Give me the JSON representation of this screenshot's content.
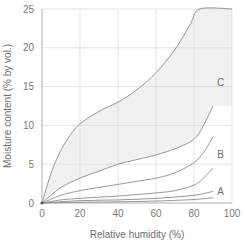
{
  "chart_data": {
    "type": "line",
    "title": "",
    "xlabel": "Relative humidity (%)",
    "ylabel": "Moisture content (% by vol.)",
    "xlim": [
      0,
      100
    ],
    "ylim": [
      0,
      25
    ],
    "xticks": [
      0,
      20,
      40,
      60,
      80,
      100
    ],
    "yticks": [
      0,
      5,
      10,
      15,
      20,
      25
    ],
    "grid": true,
    "legend": "none",
    "shaded_region": {
      "between": [
        "C upper",
        "C lower"
      ],
      "color": "#f1f1f1"
    },
    "region_labels": [
      {
        "text": "C",
        "x": 94,
        "y": 15.5
      },
      {
        "text": "B",
        "x": 94,
        "y": 6.3
      },
      {
        "text": "A",
        "x": 94,
        "y": 1.5
      }
    ],
    "series": [
      {
        "name": "C upper",
        "x": [
          0,
          5,
          10,
          15,
          20,
          30,
          40,
          50,
          60,
          70,
          78,
          83,
          100
        ],
        "y": [
          0,
          4.0,
          6.8,
          8.8,
          10.2,
          11.8,
          13.0,
          14.6,
          16.8,
          19.8,
          23.0,
          25.0,
          25.0
        ]
      },
      {
        "name": "C lower",
        "x": [
          0,
          10,
          20,
          30,
          40,
          50,
          60,
          70,
          80,
          85,
          90
        ],
        "y": [
          0,
          2.0,
          3.2,
          4.1,
          5.0,
          5.6,
          6.2,
          7.0,
          8.2,
          10.0,
          12.5
        ]
      },
      {
        "name": "B",
        "x": [
          0,
          10,
          20,
          30,
          40,
          50,
          60,
          70,
          80,
          85,
          90
        ],
        "y": [
          0,
          1.0,
          1.6,
          2.0,
          2.4,
          2.8,
          3.2,
          3.9,
          5.2,
          6.5,
          8.5
        ]
      },
      {
        "name": "A upper",
        "x": [
          0,
          10,
          20,
          40,
          60,
          70,
          80,
          85,
          90
        ],
        "y": [
          0,
          0.4,
          0.6,
          0.9,
          1.3,
          1.6,
          2.3,
          3.2,
          4.5
        ]
      },
      {
        "name": "A middle",
        "x": [
          0,
          20,
          40,
          60,
          80,
          90
        ],
        "y": [
          0,
          0.3,
          0.4,
          0.6,
          1.0,
          1.5
        ]
      },
      {
        "name": "A lower",
        "x": [
          0,
          20,
          40,
          60,
          80,
          90
        ],
        "y": [
          0,
          0.1,
          0.15,
          0.25,
          0.45,
          0.7
        ]
      }
    ]
  },
  "colors": {
    "grid": "#d9d9d9",
    "axis": "#bdbdbd",
    "line": "#8c8c8c",
    "shade": "#f1f1f1"
  }
}
